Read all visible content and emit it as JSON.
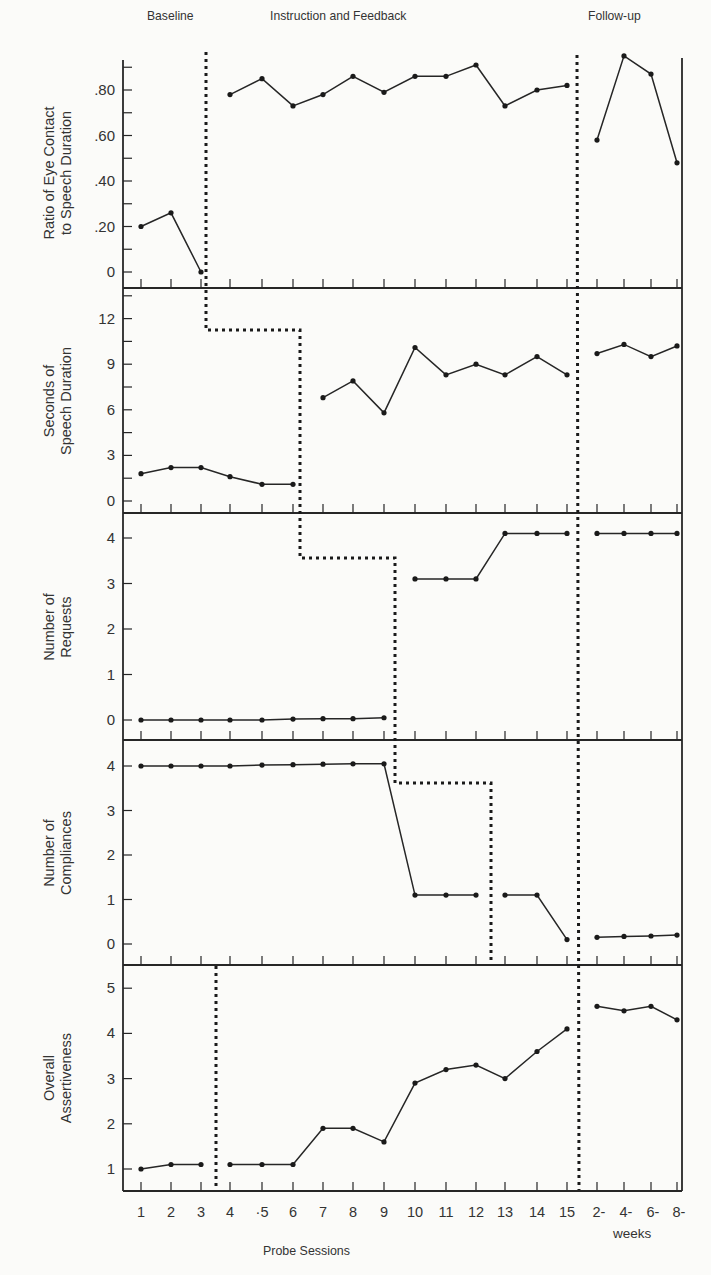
{
  "phases": {
    "baseline": "Baseline",
    "instruction": "Instruction and Feedback",
    "followup": "Follow-up"
  },
  "x_axis": {
    "title": "Probe Sessions",
    "sublabel": "weeks",
    "ticks": [
      "1",
      "2",
      "3",
      "4",
      "·5",
      "6",
      "7",
      "8",
      "9",
      "10",
      "11",
      "12",
      "13",
      "14",
      "15",
      "2-",
      "4-",
      "6-",
      "8-"
    ]
  },
  "panels": [
    {
      "ylabel_line1": "Ratio of Eye Contact",
      "ylabel_line2": "to Speech Duration",
      "ticks": [
        "0",
        ".20",
        ".40",
        ".60",
        ".80"
      ]
    },
    {
      "ylabel_line1": "Seconds of",
      "ylabel_line2": "Speech Duration",
      "ticks": [
        "0",
        "3",
        "6",
        "9",
        "12"
      ]
    },
    {
      "ylabel_line1": "Number of",
      "ylabel_line2": "Requests",
      "ticks": [
        "0",
        "1",
        "2",
        "3",
        "4"
      ]
    },
    {
      "ylabel_line1": "Number of",
      "ylabel_line2": "Compliances",
      "ticks": [
        "0",
        "1",
        "2",
        "3",
        "4"
      ]
    },
    {
      "ylabel_line1": "Overall",
      "ylabel_line2": "Assertiveness",
      "ticks": [
        "1",
        "2",
        "3",
        "4",
        "5"
      ]
    }
  ],
  "chart_data": {
    "type": "line",
    "xlabel": "Probe Sessions",
    "categories": [
      "1",
      "2",
      "3",
      "4",
      "5",
      "6",
      "7",
      "8",
      "9",
      "10",
      "11",
      "12",
      "13",
      "14",
      "15",
      "2-weeks",
      "4-weeks",
      "6-weeks",
      "8-weeks"
    ],
    "phase_labels": [
      "Baseline",
      "Instruction and Feedback",
      "Follow-up"
    ],
    "grid": false,
    "series": [
      {
        "name": "Ratio of Eye Contact to Speech Duration",
        "ylim": [
          0,
          0.95
        ],
        "segments": [
          [
            0.2,
            0.26,
            0.0
          ],
          [
            0.78,
            0.85,
            0.73,
            0.78,
            0.86,
            0.79,
            0.86,
            0.86,
            0.91,
            0.73,
            0.8,
            0.82
          ],
          [
            0.58,
            0.95,
            0.87,
            0.48
          ]
        ],
        "values": [
          0.2,
          0.26,
          0.0,
          0.78,
          0.85,
          0.73,
          0.78,
          0.86,
          0.79,
          0.86,
          0.86,
          0.91,
          0.73,
          0.8,
          0.82,
          0.58,
          0.95,
          0.87,
          0.48
        ],
        "intervention_after_session": 3
      },
      {
        "name": "Seconds of Speech Duration",
        "ylim": [
          0,
          14
        ],
        "segments": [
          [
            1.8,
            2.2,
            2.2,
            1.6,
            1.1,
            1.1
          ],
          [
            6.8,
            7.9,
            5.8,
            10.1,
            8.3,
            9.0,
            8.3,
            9.5,
            8.3
          ],
          [
            9.7,
            10.3,
            9.5,
            10.2
          ]
        ],
        "values": [
          1.8,
          2.2,
          2.2,
          1.6,
          1.1,
          1.1,
          6.8,
          7.9,
          5.8,
          10.1,
          8.3,
          9.0,
          8.3,
          9.5,
          8.3,
          9.7,
          10.3,
          9.5,
          10.2
        ],
        "intervention_after_session": 6
      },
      {
        "name": "Number of Requests",
        "ylim": [
          0,
          4.5
        ],
        "segments": [
          [
            0,
            0,
            0,
            0,
            0,
            0.02,
            0.03,
            0.03,
            0.05
          ],
          [
            3.1,
            3.1,
            3.1,
            4.1,
            4.1,
            4.1
          ],
          [
            4.1,
            4.1,
            4.1,
            4.1
          ]
        ],
        "values": [
          0,
          0,
          0,
          0,
          0,
          0.02,
          0.03,
          0.03,
          0.05,
          3.1,
          3.1,
          3.1,
          4.1,
          4.1,
          4.1,
          4.1,
          4.1,
          4.1,
          4.1
        ],
        "intervention_after_session": 9
      },
      {
        "name": "Number of Compliances",
        "ylim": [
          0,
          4.5
        ],
        "segments": [
          [
            4.0,
            4.0,
            4.0,
            4.0,
            4.02,
            4.03,
            4.04,
            4.05,
            4.05,
            1.1,
            1.1,
            1.1
          ],
          [
            1.1,
            1.1,
            0.1
          ],
          [
            0.15,
            0.17,
            0.18,
            0.2
          ]
        ],
        "values": [
          4.0,
          4.0,
          4.0,
          4.0,
          4.02,
          4.03,
          4.04,
          4.05,
          4.05,
          1.1,
          1.1,
          1.1,
          1.1,
          1.1,
          0.1,
          0.15,
          0.17,
          0.18,
          0.2
        ],
        "intervention_after_session": 12
      },
      {
        "name": "Overall Assertiveness",
        "ylim": [
          0.5,
          5.5
        ],
        "segments": [
          [
            1.0,
            1.1,
            1.1
          ],
          [
            1.1,
            1.1,
            1.1,
            1.9,
            1.9,
            1.6,
            2.9,
            3.2,
            3.3,
            3.0,
            3.6,
            4.1
          ],
          [
            4.6,
            4.5,
            4.6,
            4.3
          ]
        ],
        "values": [
          1.0,
          1.1,
          1.1,
          1.1,
          1.1,
          1.1,
          1.9,
          1.9,
          1.6,
          2.9,
          3.2,
          3.3,
          3.0,
          3.6,
          4.1,
          4.6,
          4.5,
          4.6,
          4.3
        ],
        "intervention_after_session": 3
      }
    ],
    "followup_after_session": 15
  }
}
